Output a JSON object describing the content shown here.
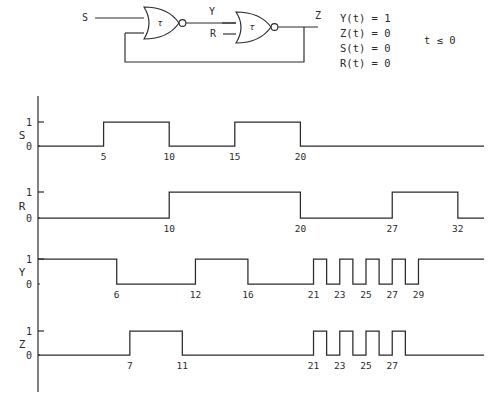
{
  "figure": {
    "kind": "digital-timing-diagram-with-nor-latch-schematic"
  },
  "schematic": {
    "title": "",
    "inputs": [
      {
        "name": "S",
        "label": "S"
      },
      {
        "name": "R",
        "label": "R"
      }
    ],
    "nets": [
      {
        "name": "Y",
        "label": "Y"
      },
      {
        "name": "Z",
        "label": "Z"
      }
    ],
    "gates": [
      {
        "name": "gate1",
        "type": "NOR",
        "delay_label": "τ"
      },
      {
        "name": "gate2",
        "type": "NOR",
        "delay_label": "τ"
      }
    ],
    "feedback": {
      "from": "Z",
      "to": "gate1-input-2"
    }
  },
  "initial_conditions": {
    "lines": [
      "Y(t)  =  1",
      "Z(t)  =  0",
      "S(t)  =  0",
      "R(t)  =  0"
    ],
    "condition": "t ≤ 0"
  },
  "chart_data": {
    "type": "line",
    "title": "",
    "xlabel": "",
    "ylabel": "",
    "xlim": [
      0,
      34
    ],
    "ylim": [
      0,
      1
    ],
    "grid": false,
    "legend": "none",
    "y_tick_labels": [
      "0",
      "1"
    ],
    "series": [
      {
        "name": "S",
        "label": "S",
        "initial_value": 0,
        "final_value": 0,
        "tick_labels": [
          "5",
          "10",
          "15",
          "20"
        ],
        "transitions": [
          {
            "t": 5,
            "to": 1
          },
          {
            "t": 10,
            "to": 0
          },
          {
            "t": 15,
            "to": 1
          },
          {
            "t": 20,
            "to": 0
          }
        ]
      },
      {
        "name": "R",
        "label": "R",
        "initial_value": 0,
        "final_value": 0,
        "tick_labels": [
          "10",
          "20",
          "27",
          "32"
        ],
        "transitions": [
          {
            "t": 10,
            "to": 1
          },
          {
            "t": 20,
            "to": 0
          },
          {
            "t": 27,
            "to": 1
          },
          {
            "t": 32,
            "to": 0
          }
        ]
      },
      {
        "name": "Y",
        "label": "Y",
        "initial_value": 1,
        "final_value": 1,
        "tick_labels": [
          "6",
          "12",
          "16",
          "21",
          "23",
          "25",
          "27",
          "29"
        ],
        "transitions": [
          {
            "t": 6,
            "to": 0
          },
          {
            "t": 12,
            "to": 1
          },
          {
            "t": 16,
            "to": 0
          },
          {
            "t": 21,
            "to": 1
          },
          {
            "t": 22,
            "to": 0
          },
          {
            "t": 23,
            "to": 1
          },
          {
            "t": 24,
            "to": 0
          },
          {
            "t": 25,
            "to": 1
          },
          {
            "t": 26,
            "to": 0
          },
          {
            "t": 27,
            "to": 1
          },
          {
            "t": 28,
            "to": 0
          },
          {
            "t": 29,
            "to": 1
          }
        ]
      },
      {
        "name": "Z",
        "label": "Z",
        "initial_value": 0,
        "final_value": 0,
        "tick_labels": [
          "7",
          "11",
          "21",
          "23",
          "25",
          "27"
        ],
        "transitions": [
          {
            "t": 7,
            "to": 1
          },
          {
            "t": 11,
            "to": 0
          },
          {
            "t": 21,
            "to": 1
          },
          {
            "t": 22,
            "to": 0
          },
          {
            "t": 23,
            "to": 1
          },
          {
            "t": 24,
            "to": 0
          },
          {
            "t": 25,
            "to": 1
          },
          {
            "t": 26,
            "to": 0
          },
          {
            "t": 27,
            "to": 1
          },
          {
            "t": 28,
            "to": 0
          }
        ]
      }
    ]
  },
  "colors": {
    "ink": "#2a2a2a",
    "paper": "#ffffff"
  }
}
